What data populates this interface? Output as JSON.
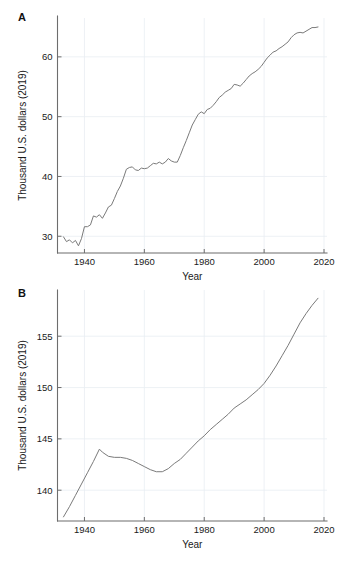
{
  "figure": {
    "background": "#ffffff",
    "line_color": "#7a7a7a",
    "grid_color": "#e9eef2",
    "axis_color": "#6d6d6d"
  },
  "panels": [
    {
      "letter": "A",
      "ylabel": "Thousand U.S. dollars (2019)",
      "xlabel": "Year"
    },
    {
      "letter": "B",
      "ylabel": "Thousand U.S. dollars (2019)",
      "xlabel": "Year"
    }
  ],
  "chart_data": [
    {
      "id": "panel-a",
      "type": "line",
      "title": "A",
      "xlabel": "Year",
      "ylabel": "Thousand U.S. dollars (2019)",
      "xlim": [
        1931,
        2021
      ],
      "ylim": [
        27.2,
        66.5
      ],
      "xticks": [
        1940,
        1960,
        1980,
        2000,
        2020
      ],
      "xtick_labels": [
        "1940",
        "1960",
        "1980",
        "2000",
        "2020"
      ],
      "yticks": [
        30,
        40,
        50,
        60
      ],
      "ytick_labels": [
        "30",
        "40",
        "50",
        "60"
      ],
      "grid": true,
      "legend": null,
      "series": [
        {
          "name": "median earnings",
          "color": "#7a7a7a",
          "x": [
            1933,
            1934,
            1935,
            1936,
            1937,
            1938,
            1939,
            1940,
            1941,
            1942,
            1943,
            1944,
            1945,
            1946,
            1947,
            1948,
            1949,
            1950,
            1951,
            1952,
            1953,
            1954,
            1955,
            1956,
            1957,
            1958,
            1959,
            1960,
            1961,
            1962,
            1963,
            1964,
            1965,
            1966,
            1967,
            1968,
            1969,
            1970,
            1971,
            1972,
            1973,
            1974,
            1975,
            1976,
            1977,
            1978,
            1979,
            1980,
            1981,
            1982,
            1983,
            1984,
            1985,
            1986,
            1987,
            1988,
            1989,
            1990,
            1991,
            1992,
            1993,
            1994,
            1995,
            1996,
            1997,
            1998,
            1999,
            2000,
            2001,
            2002,
            2003,
            2004,
            2005,
            2006,
            2007,
            2008,
            2009,
            2010,
            2011,
            2012,
            2013,
            2014,
            2015,
            2016,
            2017,
            2018
          ],
          "y": [
            29.9,
            29.1,
            29.4,
            28.9,
            29.3,
            28.4,
            29.6,
            31.6,
            31.6,
            31.9,
            33.4,
            33.2,
            33.6,
            33.0,
            33.9,
            34.9,
            35.2,
            36.3,
            37.5,
            38.4,
            39.7,
            41.2,
            41.5,
            41.6,
            41.1,
            41.0,
            41.4,
            41.3,
            41.4,
            41.8,
            42.2,
            42.1,
            42.4,
            42.1,
            42.4,
            43.0,
            42.6,
            42.4,
            42.4,
            43.5,
            44.8,
            46.0,
            47.3,
            48.6,
            49.5,
            50.4,
            50.8,
            50.5,
            51.2,
            51.4,
            51.9,
            52.5,
            53.2,
            53.6,
            54.1,
            54.4,
            54.7,
            55.4,
            55.3,
            55.1,
            55.6,
            56.2,
            56.8,
            57.2,
            57.5,
            57.9,
            58.4,
            59.1,
            59.8,
            60.3,
            60.8,
            61.0,
            61.4,
            61.7,
            62.1,
            62.5,
            63.2,
            63.7,
            64.0,
            64.1,
            64.0,
            64.3,
            64.6,
            64.9,
            64.9,
            65.0
          ]
        }
      ]
    },
    {
      "id": "panel-b",
      "type": "line",
      "title": "B",
      "xlabel": "Year",
      "ylabel": "Thousand U.S. dollars (2019)",
      "xlim": [
        1931,
        2021
      ],
      "ylim": [
        137.0,
        159.5
      ],
      "xticks": [
        1940,
        1960,
        1980,
        2000,
        2020
      ],
      "xtick_labels": [
        "1940",
        "1960",
        "1980",
        "2000",
        "2020"
      ],
      "yticks": [
        140,
        145,
        150,
        155
      ],
      "ytick_labels": [
        "140",
        "145",
        "150",
        "155"
      ],
      "grid": true,
      "legend": null,
      "series": [
        {
          "name": "lifetime earnings",
          "color": "#7a7a7a",
          "x": [
            1933,
            1935,
            1937,
            1939,
            1941,
            1943,
            1945,
            1946,
            1948,
            1950,
            1952,
            1954,
            1956,
            1958,
            1960,
            1962,
            1964,
            1966,
            1968,
            1970,
            1972,
            1974,
            1976,
            1978,
            1980,
            1982,
            1984,
            1986,
            1988,
            1990,
            1992,
            1994,
            1996,
            1998,
            2000,
            2002,
            2004,
            2006,
            2008,
            2010,
            2012,
            2014,
            2016,
            2018
          ],
          "y": [
            137.4,
            138.4,
            139.5,
            140.6,
            141.7,
            142.8,
            144.0,
            143.7,
            143.3,
            143.2,
            143.2,
            143.1,
            142.9,
            142.6,
            142.3,
            142.0,
            141.8,
            141.8,
            142.1,
            142.6,
            143.0,
            143.6,
            144.2,
            144.8,
            145.3,
            145.9,
            146.4,
            146.9,
            147.4,
            148.0,
            148.4,
            148.8,
            149.3,
            149.8,
            150.4,
            151.2,
            152.1,
            153.1,
            154.1,
            155.2,
            156.3,
            157.2,
            158.0,
            158.7
          ]
        }
      ]
    }
  ]
}
